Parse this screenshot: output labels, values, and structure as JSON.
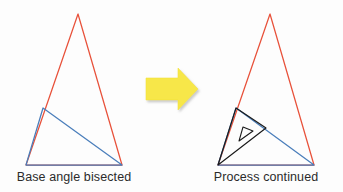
{
  "figure": {
    "background_color": "#fdfdfd",
    "caption_color": "#2b2b2b",
    "left_caption": "Base angle bisected",
    "right_caption": "Process continued",
    "arrow_icon_name": "right-arrow-icon",
    "colors": {
      "red": "#e8513a",
      "blue": "#4a7ebb",
      "black": "#1a1a1a",
      "arrow_fill": "#f7e748",
      "arrow_shadow": "#d8d8d8"
    },
    "left_diagram": {
      "name": "base-angle-bisected-diagram",
      "red_triangle": {
        "apex": [
          78,
          14
        ],
        "base_left": [
          26,
          165
        ],
        "base_right": [
          122,
          165
        ]
      },
      "blue_triangle": {
        "bisector_point": [
          43,
          108
        ],
        "base_left": [
          26,
          165
        ],
        "base_right": [
          122,
          165
        ]
      }
    },
    "right_diagram": {
      "name": "process-continued-diagram",
      "red_triangle": {
        "apex": [
          270,
          14
        ],
        "base_left": [
          218,
          165
        ],
        "base_right": [
          314,
          165
        ]
      },
      "blue_triangle": {
        "bisector_point": [
          236,
          108
        ],
        "base_left": [
          218,
          165
        ],
        "base_right": [
          314,
          165
        ]
      },
      "black_triangle": {
        "top": [
          236,
          108
        ],
        "base_left": [
          218,
          165
        ],
        "hypotenuse_point": [
          266,
          128
        ]
      },
      "inner_black_triangle": {
        "top": [
          243,
          127
        ],
        "left": [
          239,
          141
        ],
        "right": [
          253,
          131
        ]
      }
    },
    "arrow": {
      "shaft_left": 146,
      "shaft_top": 78,
      "shaft_right": 178,
      "shaft_bottom": 100,
      "head_tip_x": 198,
      "head_top": 68,
      "head_bottom": 110
    }
  },
  "chart_data": {
    "type": "diagram",
    "title": "",
    "panels": [
      {
        "label": "Base angle bisected",
        "shapes": [
          {
            "kind": "triangle",
            "color": "#e8513a",
            "points": [
              [
                78,
                14
              ],
              [
                26,
                165
              ],
              [
                122,
                165
              ]
            ],
            "filled": false
          },
          {
            "kind": "triangle",
            "color": "#4a7ebb",
            "points": [
              [
                43,
                108
              ],
              [
                26,
                165
              ],
              [
                122,
                165
              ]
            ],
            "filled": false
          }
        ]
      },
      {
        "label": "Process continued",
        "shapes": [
          {
            "kind": "triangle",
            "color": "#e8513a",
            "points": [
              [
                270,
                14
              ],
              [
                218,
                165
              ],
              [
                314,
                165
              ]
            ],
            "filled": false
          },
          {
            "kind": "triangle",
            "color": "#4a7ebb",
            "points": [
              [
                236,
                108
              ],
              [
                218,
                165
              ],
              [
                314,
                165
              ]
            ],
            "filled": false
          },
          {
            "kind": "triangle",
            "color": "#1a1a1a",
            "points": [
              [
                236,
                108
              ],
              [
                218,
                165
              ],
              [
                266,
                128
              ]
            ],
            "filled": false
          },
          {
            "kind": "triangle",
            "color": "#1a1a1a",
            "points": [
              [
                243,
                127
              ],
              [
                239,
                141
              ],
              [
                253,
                131
              ]
            ],
            "filled": false
          }
        ]
      }
    ],
    "connector": {
      "kind": "arrow",
      "direction": "right",
      "color": "#f7e748"
    }
  }
}
